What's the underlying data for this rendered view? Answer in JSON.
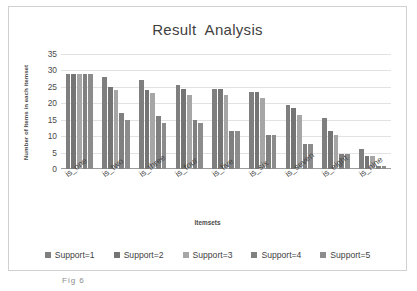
{
  "chart_data": {
    "type": "bar",
    "title": "Result  Analysis",
    "xlabel": "Itemsets",
    "ylabel": "Number of Items in each itemset",
    "categories": [
      "is_one",
      "is_two",
      "is_three",
      "is_four",
      "is_five",
      "is_six",
      "is_seven",
      "is_eight",
      "is_nine"
    ],
    "series": [
      {
        "name": "Support=1",
        "color": "#7f7f7f",
        "values": [
          29,
          28,
          27,
          25.5,
          24.5,
          23.5,
          19.5,
          15.5,
          6
        ]
      },
      {
        "name": "Support=2",
        "color": "#757575",
        "values": [
          29,
          25,
          24,
          24.5,
          24.5,
          23.5,
          18.5,
          11.5,
          4
        ]
      },
      {
        "name": "Support=3",
        "color": "#a6a6a6",
        "values": [
          29,
          24,
          23,
          22.5,
          22.5,
          21.5,
          16.5,
          10.5,
          4
        ]
      },
      {
        "name": "Support=4",
        "color": "#808080",
        "values": [
          29,
          17,
          16,
          15,
          11.5,
          10.5,
          7.5,
          4.5,
          1
        ]
      },
      {
        "name": "Support=5",
        "color": "#8c8c8c",
        "values": [
          29,
          15,
          14,
          14,
          11.5,
          10.5,
          7.5,
          4.5,
          1
        ]
      }
    ],
    "ylim": [
      0,
      35
    ],
    "yticks": [
      0,
      5,
      10,
      15,
      20,
      25,
      30,
      35
    ],
    "grid": true,
    "legend_position": "bottom"
  },
  "caption": "Fig 6"
}
